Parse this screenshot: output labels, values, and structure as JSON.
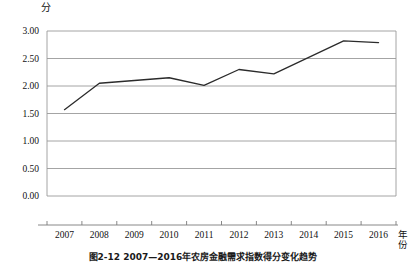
{
  "figure": {
    "y_unit_label": "分",
    "x_unit_label": "年份",
    "caption": "图2-12  2007—2016年农房金融需求指数得分变化趋势"
  },
  "chart_data": {
    "type": "line",
    "title": "",
    "xlabel": "年份",
    "ylabel": "分",
    "categories": [
      "2007",
      "2008",
      "2009",
      "2010",
      "2011",
      "2012",
      "2013",
      "2014",
      "2015",
      "2016"
    ],
    "x": [
      2007,
      2008,
      2009,
      2010,
      2011,
      2012,
      2013,
      2014,
      2015,
      2016
    ],
    "values": [
      1.57,
      2.05,
      2.1,
      2.15,
      2.01,
      2.3,
      2.22,
      2.52,
      2.82,
      2.79
    ],
    "series": [
      {
        "name": "得分",
        "values": [
          1.57,
          2.05,
          2.1,
          2.15,
          2.01,
          2.3,
          2.22,
          2.52,
          2.82,
          2.79
        ]
      }
    ],
    "ylim": [
      0.0,
      3.0
    ],
    "ytick_values": [
      3.0,
      2.5,
      2.0,
      1.5,
      1.0,
      0.5,
      0.0
    ],
    "ytick_labels": [
      "3.00",
      "2.50",
      "2.00",
      "1.50",
      "1.00",
      "0.50",
      "0.00"
    ],
    "grid": true,
    "grid_axis": "y",
    "legend": "none",
    "line_color": "#2b2b2b",
    "grid_color": "#9a9a9a",
    "axis_color": "#7a7a7a",
    "markers": false
  }
}
